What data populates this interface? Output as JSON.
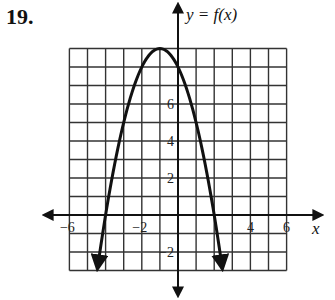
{
  "problem": {
    "number": "19."
  },
  "chart_data": {
    "type": "line",
    "title": "",
    "function_label": "y = f(x)",
    "xlabel": "x",
    "ylabel": "y",
    "function": "f(x) = -(x + 1)^2 + 9",
    "vertex": [
      -1,
      9
    ],
    "x_intercepts": [
      -4,
      2
    ],
    "y_intercept": 8,
    "xlim": [
      -6,
      6
    ],
    "ylim": [
      -3,
      9
    ],
    "grid": true,
    "grid_step": 1,
    "x_tick_labels": [
      "−6",
      "−2",
      "4",
      "6"
    ],
    "x_tick_values": [
      -6,
      -2,
      4,
      6
    ],
    "y_tick_labels": [
      "6",
      "4",
      "2",
      "−2"
    ],
    "y_tick_values": [
      6,
      4,
      2,
      -2
    ],
    "sample_points": [
      {
        "x": -4.45,
        "y": -2.9
      },
      {
        "x": -4,
        "y": 0
      },
      {
        "x": -3,
        "y": 5
      },
      {
        "x": -2,
        "y": 8
      },
      {
        "x": -1,
        "y": 9
      },
      {
        "x": 0,
        "y": 8
      },
      {
        "x": 1,
        "y": 5
      },
      {
        "x": 2,
        "y": 0
      },
      {
        "x": 2.45,
        "y": -2.9
      }
    ],
    "ends_with_arrows": true,
    "colors": {
      "curve": "#111111",
      "grid": "#333333",
      "axes": "#111111"
    }
  }
}
